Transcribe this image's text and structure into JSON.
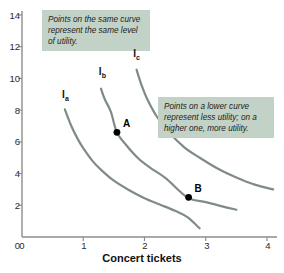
{
  "chart_data": {
    "type": "line",
    "title": "",
    "xlabel": "Concert tickets",
    "ylabel": "",
    "xlim": [
      0,
      4.28
    ],
    "ylim": [
      0,
      14.9
    ],
    "grid": false,
    "legend_position": "inline-curve-labels",
    "xticks": [
      "0",
      "1",
      "2",
      "3",
      "4"
    ],
    "xtick_values": [
      0,
      1,
      2,
      3,
      4
    ],
    "yticks": [
      "0",
      "2",
      "4",
      "6",
      "8",
      "10",
      "12",
      "14"
    ],
    "ytick_values": [
      0,
      2,
      4,
      6,
      8,
      10,
      12,
      14
    ],
    "series": [
      {
        "name": "Ia",
        "label_html": "I<sub>a</sub>",
        "label_x": 0.72,
        "label_y": 8.9,
        "points": [
          [
            0.7,
            8.05
          ],
          [
            0.8,
            7.05
          ],
          [
            0.9,
            6.25
          ],
          [
            1.0,
            5.6
          ],
          [
            1.15,
            4.8
          ],
          [
            1.3,
            4.2
          ],
          [
            1.5,
            3.55
          ],
          [
            1.75,
            2.95
          ],
          [
            2.0,
            2.45
          ],
          [
            2.25,
            2.05
          ],
          [
            2.5,
            1.65
          ],
          [
            2.7,
            1.25
          ],
          [
            2.9,
            0.55
          ]
        ]
      },
      {
        "name": "Ib",
        "label_html": "I<sub>b</sub>",
        "label_x": 1.32,
        "label_y": 10.35,
        "points": [
          [
            1.29,
            9.35
          ],
          [
            1.35,
            8.7
          ],
          [
            1.45,
            7.9
          ],
          [
            1.55,
            6.6
          ],
          [
            1.7,
            5.8
          ],
          [
            1.9,
            4.95
          ],
          [
            2.1,
            4.35
          ],
          [
            2.35,
            3.7
          ],
          [
            2.7,
            2.5
          ],
          [
            3.0,
            2.2
          ],
          [
            3.25,
            1.95
          ],
          [
            3.5,
            1.72
          ]
        ]
      },
      {
        "name": "Ic",
        "label_html": "I<sub>c</sub>",
        "label_x": 1.88,
        "label_y": 11.5,
        "points": [
          [
            1.87,
            10.55
          ],
          [
            1.95,
            9.6
          ],
          [
            2.05,
            8.65
          ],
          [
            2.2,
            7.6
          ],
          [
            2.4,
            6.6
          ],
          [
            2.65,
            5.65
          ],
          [
            2.9,
            5.0
          ],
          [
            3.2,
            4.3
          ],
          [
            3.5,
            3.75
          ],
          [
            3.8,
            3.3
          ],
          [
            4.1,
            3.0
          ]
        ]
      }
    ],
    "annotated_points": [
      {
        "label": "A",
        "x": 1.55,
        "y": 6.6,
        "on_curve": "Ib"
      },
      {
        "label": "B",
        "x": 2.72,
        "y": 2.5,
        "on_curve": "Ib"
      }
    ],
    "callouts": [
      {
        "id": "same-curve",
        "text": "Points on the same curve represent the same level of utility."
      },
      {
        "id": "lower-curve",
        "text": "Points on a lower curve represent less utility; on a higher one, more utility."
      }
    ],
    "colors": {
      "curve": "#7f8c85",
      "axis": "#8d8d8d",
      "callout_bg": "#c3d2c6",
      "point": "#000000",
      "text": "#1d1d1d",
      "background": "#ffffff"
    }
  }
}
